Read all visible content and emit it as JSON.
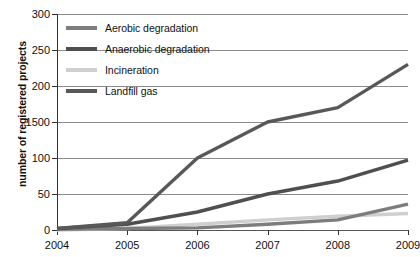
{
  "chart_data": {
    "type": "line",
    "title": "",
    "xlabel": "",
    "ylabel": "number of registered projects",
    "categories": [
      "2004",
      "2005",
      "2006",
      "2007",
      "2008",
      "2009"
    ],
    "x": [
      2004,
      2005,
      2006,
      2007,
      2008,
      2009
    ],
    "ylim": [
      0,
      300
    ],
    "yticks": [
      0,
      50,
      100,
      150,
      200,
      250,
      300
    ],
    "ytick_labels": [
      "0",
      "50",
      "100",
      "1500",
      "200",
      "250",
      "300"
    ],
    "grid": "horizontal",
    "legend_position": "upper-left-inside",
    "series": [
      {
        "name": "Aerobic degradation",
        "color": "#7d7d7d",
        "values": [
          1,
          2,
          3,
          8,
          14,
          36
        ]
      },
      {
        "name": "Anaerobic degradation",
        "color": "#4f4f4f",
        "values": [
          2,
          8,
          25,
          50,
          68,
          97
        ]
      },
      {
        "name": "Incineration",
        "color": "#cfcfcf",
        "values": [
          0,
          2,
          8,
          14,
          19,
          23
        ]
      },
      {
        "name": "Landfill gas",
        "color": "#585858",
        "values": [
          2,
          10,
          100,
          150,
          170,
          230
        ]
      }
    ]
  },
  "axis": {
    "y_title": "number of registered projects"
  },
  "legend": {
    "items": [
      {
        "label": "Aerobic degradation",
        "color": "#7d7d7d"
      },
      {
        "label": "Anaerobic degradation",
        "color": "#4f4f4f"
      },
      {
        "label": "Incineration",
        "color": "#cfcfcf"
      },
      {
        "label": "Landfill gas",
        "color": "#585858"
      }
    ]
  },
  "colors": {
    "background": "#ffffff",
    "gridline": "#8a8a8a",
    "axis": "#333333",
    "text": "#111111"
  }
}
